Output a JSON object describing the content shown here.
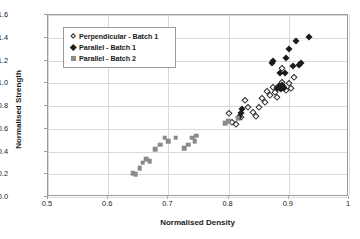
{
  "chart_data": {
    "type": "scatter",
    "title": "",
    "xlabel": "Normalised Density",
    "ylabel": "Normalised Strength",
    "xlim": [
      0.5,
      1.0
    ],
    "ylim": [
      0.0,
      1.6
    ],
    "xticks": [
      "0.5",
      "0.6",
      "0.7",
      "0.8",
      "0.9",
      "1"
    ],
    "xtick_values": [
      0.5,
      0.6,
      0.7,
      0.8,
      0.9,
      1.0
    ],
    "yticks": [
      "0.0",
      "0.2",
      "0.4",
      "0.6",
      "0.8",
      "1.0",
      "1.2",
      "1.4",
      "1.6"
    ],
    "ytick_values": [
      0.0,
      0.2,
      0.4,
      0.6,
      0.8,
      1.0,
      1.2,
      1.4,
      1.6
    ],
    "grid": "horizontal-and-vertical",
    "legend_position": "upper-left-inside",
    "series": [
      {
        "name": "Perpendicular - Batch 1",
        "marker": "open-diamond",
        "color": "#2b2b2b",
        "points": [
          [
            0.8,
            0.735
          ],
          [
            0.806,
            0.66
          ],
          [
            0.812,
            0.645
          ],
          [
            0.82,
            0.7
          ],
          [
            0.827,
            0.855
          ],
          [
            0.833,
            0.79
          ],
          [
            0.84,
            0.745
          ],
          [
            0.845,
            0.715
          ],
          [
            0.851,
            0.795
          ],
          [
            0.856,
            0.87
          ],
          [
            0.861,
            0.835
          ],
          [
            0.864,
            0.93
          ],
          [
            0.869,
            0.9
          ],
          [
            0.873,
            0.965
          ],
          [
            0.877,
            0.925
          ],
          [
            0.88,
            0.88
          ],
          [
            0.884,
            0.96
          ],
          [
            0.888,
            1.01
          ],
          [
            0.891,
            0.975
          ],
          [
            0.896,
            0.945
          ],
          [
            0.9,
            1.0
          ],
          [
            0.904,
            0.96
          ],
          [
            0.908,
            1.055
          ],
          [
            0.889,
            1.135
          ]
        ]
      },
      {
        "name": "Parallel - Batch 1",
        "marker": "filled-diamond",
        "color": "#1c1c1c",
        "points": [
          [
            0.818,
            0.7
          ],
          [
            0.82,
            0.74
          ],
          [
            0.822,
            0.77
          ],
          [
            0.881,
            0.96
          ],
          [
            0.884,
            0.975
          ],
          [
            0.887,
            0.95
          ],
          [
            0.889,
            0.985
          ],
          [
            0.892,
            0.96
          ],
          [
            0.872,
            1.175
          ],
          [
            0.874,
            1.195
          ],
          [
            0.886,
            1.09
          ],
          [
            0.893,
            1.09
          ],
          [
            0.896,
            1.225
          ],
          [
            0.901,
            1.3
          ],
          [
            0.907,
            1.15
          ],
          [
            0.917,
            1.16
          ],
          [
            0.921,
            1.175
          ],
          [
            0.912,
            1.375
          ],
          [
            0.934,
            1.405
          ]
        ]
      },
      {
        "name": "Parallel - Batch 2",
        "marker": "filled-square",
        "color": "#8a8a8a",
        "points": [
          [
            0.641,
            0.21
          ],
          [
            0.646,
            0.2
          ],
          [
            0.652,
            0.255
          ],
          [
            0.657,
            0.3
          ],
          [
            0.663,
            0.33
          ],
          [
            0.669,
            0.315
          ],
          [
            0.678,
            0.42
          ],
          [
            0.686,
            0.46
          ],
          [
            0.694,
            0.52
          ],
          [
            0.7,
            0.49
          ],
          [
            0.712,
            0.52
          ],
          [
            0.726,
            0.43
          ],
          [
            0.733,
            0.46
          ],
          [
            0.74,
            0.52
          ],
          [
            0.744,
            0.49
          ],
          [
            0.746,
            0.54
          ],
          [
            0.794,
            0.65
          ],
          [
            0.799,
            0.665
          ],
          [
            0.815,
            0.695
          ]
        ]
      }
    ]
  },
  "legend": {
    "items": [
      {
        "label": "Perpendicular - Batch 1",
        "marker": "open-diamond"
      },
      {
        "label": "Parallel - Batch 1",
        "marker": "filled-diamond"
      },
      {
        "label": "Parallel - Batch 2",
        "marker": "filled-square"
      }
    ]
  }
}
